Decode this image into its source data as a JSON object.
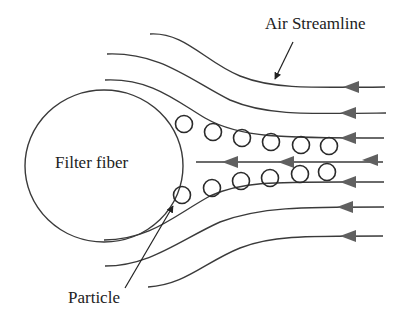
{
  "diagram": {
    "type": "particle filtration schematic",
    "labels": {
      "air_streamline": "Air Streamline",
      "filter_fiber": "Filter fiber",
      "particle": "Particle"
    },
    "colors": {
      "line": "#3a3a3a",
      "arrow": "#606060",
      "particle_stroke": "#2a2a2a",
      "text": "#222222",
      "background": "#ffffff"
    },
    "flow_direction": "right-to-left",
    "streamline_count": 7,
    "particle_count": 12,
    "particle_rows": [
      {
        "row": "upper",
        "count": 6
      },
      {
        "row": "lower",
        "count": 6
      }
    ]
  }
}
